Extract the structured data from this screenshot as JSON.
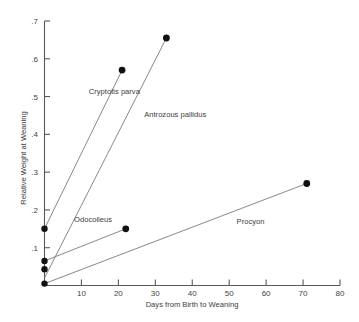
{
  "chart_data": {
    "type": "line",
    "title": "",
    "xlabel": "Days from Birth to Weaning",
    "ylabel": "Relative Weight at Weaning",
    "xlim": [
      0,
      80
    ],
    "ylim": [
      0,
      0.7
    ],
    "xticks": [
      10,
      20,
      30,
      40,
      50,
      60,
      70,
      80
    ],
    "xticklabels": [
      "10",
      "20",
      "30",
      "40",
      "50",
      "60",
      "70",
      "80"
    ],
    "yticks": [
      0.1,
      0.2,
      0.3,
      0.4,
      0.5,
      0.6,
      0.7
    ],
    "yticklabels": [
      ".1",
      ".2",
      ".3",
      ".4",
      ".5",
      ".6",
      ".7"
    ],
    "grid": false,
    "legend": "inline-annotations",
    "series": [
      {
        "name": "Cryptotis parva",
        "x": [
          0,
          21
        ],
        "y": [
          0.15,
          0.57
        ],
        "label": "Cryptotis parva",
        "label_x": 12,
        "label_y": 0.508,
        "marker_end": true
      },
      {
        "name": "Antrozous pallidus",
        "x": [
          0,
          33
        ],
        "y": [
          0.02,
          0.655
        ],
        "label": "Antrozous pallidus",
        "label_x": 27,
        "label_y": 0.447,
        "marker_end": true
      },
      {
        "name": "Odocoileus",
        "x": [
          0,
          22
        ],
        "y": [
          0.065,
          0.15
        ],
        "label": "Odocoileus",
        "label_x": 8,
        "label_y": 0.168,
        "marker_end": true
      },
      {
        "name": "Procyon",
        "x": [
          0,
          71
        ],
        "y": [
          0.005,
          0.27
        ],
        "label": "Procyon",
        "label_x": 52,
        "label_y": 0.163,
        "marker_end": true
      }
    ],
    "origin_markers": [
      {
        "name": "Cryptotis parva",
        "x": 0,
        "y": 0.15
      },
      {
        "name": "Odocoileus",
        "x": 0,
        "y": 0.065
      },
      {
        "name": "Antrozous pallidus",
        "x": 0,
        "y": 0.043
      },
      {
        "name": "Procyon",
        "x": 0,
        "y": 0.005
      }
    ]
  }
}
